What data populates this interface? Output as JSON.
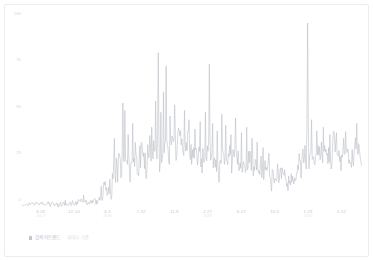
{
  "card": {
    "border_color": "#ededf0",
    "background": "#ffffff"
  },
  "legend": {
    "marker_color": "#c2c5ca",
    "series_label": "검색어트렌드",
    "sub_label": "데이터 기준"
  },
  "chart_data": {
    "type": "line",
    "title": "",
    "xlabel": "",
    "ylabel": "",
    "grid": false,
    "legend_position": "bottom-left",
    "line_color": "#bcc0c6",
    "line_width": 0.6,
    "ylim": [
      0,
      100
    ],
    "yticks": [
      0,
      25,
      50,
      75,
      100
    ],
    "ytick_labels": [
      "0",
      "25",
      "50",
      "75",
      "100"
    ],
    "xtick_positions": [
      0.055,
      0.153,
      0.251,
      0.35,
      0.448,
      0.546,
      0.645,
      0.743,
      0.841,
      0.94
    ],
    "xtick_labels": [
      "8.26",
      "12.14",
      "4.3",
      "7.22",
      "11.9",
      "2.27",
      "6.17",
      "10.5",
      "1.23",
      "5.12"
    ],
    "xtick_sublabels": [
      "2017",
      "",
      "2018",
      "",
      "",
      "2019",
      "",
      "",
      "2020",
      ""
    ],
    "n_points": 520,
    "series": [
      {
        "name": "검색어트렌드",
        "baseline_segments": [
          {
            "from": 0.0,
            "to": 0.225,
            "level": 2.2,
            "noise": 1.1
          },
          {
            "from": 0.225,
            "to": 0.265,
            "level": 6.0,
            "noise": 4.0
          },
          {
            "from": 0.265,
            "to": 0.33,
            "level": 22.0,
            "noise": 11.0
          },
          {
            "from": 0.33,
            "to": 0.42,
            "level": 27.0,
            "noise": 11.0
          },
          {
            "from": 0.42,
            "to": 0.52,
            "level": 29.0,
            "noise": 12.0
          },
          {
            "from": 0.52,
            "to": 0.62,
            "level": 28.0,
            "noise": 11.0
          },
          {
            "from": 0.62,
            "to": 0.7,
            "level": 26.0,
            "noise": 10.0
          },
          {
            "from": 0.7,
            "to": 0.77,
            "level": 21.0,
            "noise": 8.0
          },
          {
            "from": 0.77,
            "to": 0.81,
            "level": 14.0,
            "noise": 6.0
          },
          {
            "from": 0.81,
            "to": 0.87,
            "level": 26.0,
            "noise": 9.0
          },
          {
            "from": 0.87,
            "to": 1.0,
            "level": 30.0,
            "noise": 10.0
          }
        ],
        "spikes": [
          {
            "x": 0.182,
            "y": 7.5
          },
          {
            "x": 0.243,
            "y": 13.0
          },
          {
            "x": 0.258,
            "y": 16.0
          },
          {
            "x": 0.272,
            "y": 38.0
          },
          {
            "x": 0.286,
            "y": 30.0
          },
          {
            "x": 0.297,
            "y": 57.0
          },
          {
            "x": 0.303,
            "y": 53.0
          },
          {
            "x": 0.312,
            "y": 40.0
          },
          {
            "x": 0.325,
            "y": 46.0
          },
          {
            "x": 0.347,
            "y": 34.0
          },
          {
            "x": 0.362,
            "y": 30.0
          },
          {
            "x": 0.381,
            "y": 44.0
          },
          {
            "x": 0.394,
            "y": 58.0
          },
          {
            "x": 0.4,
            "y": 84.0
          },
          {
            "x": 0.409,
            "y": 52.0
          },
          {
            "x": 0.416,
            "y": 63.0
          },
          {
            "x": 0.424,
            "y": 77.0
          },
          {
            "x": 0.435,
            "y": 50.0
          },
          {
            "x": 0.448,
            "y": 56.0
          },
          {
            "x": 0.463,
            "y": 42.0
          },
          {
            "x": 0.478,
            "y": 53.0
          },
          {
            "x": 0.492,
            "y": 48.0
          },
          {
            "x": 0.509,
            "y": 43.0
          },
          {
            "x": 0.525,
            "y": 47.0
          },
          {
            "x": 0.54,
            "y": 52.0
          },
          {
            "x": 0.551,
            "y": 78.0
          },
          {
            "x": 0.56,
            "y": 46.0
          },
          {
            "x": 0.575,
            "y": 42.0
          },
          {
            "x": 0.588,
            "y": 51.0
          },
          {
            "x": 0.6,
            "y": 45.0
          },
          {
            "x": 0.615,
            "y": 40.0
          },
          {
            "x": 0.629,
            "y": 49.0
          },
          {
            "x": 0.645,
            "y": 41.0
          },
          {
            "x": 0.66,
            "y": 44.0
          },
          {
            "x": 0.676,
            "y": 38.0
          },
          {
            "x": 0.692,
            "y": 36.0
          },
          {
            "x": 0.71,
            "y": 33.0
          },
          {
            "x": 0.726,
            "y": 30.0
          },
          {
            "x": 0.84,
            "y": 100.0
          },
          {
            "x": 0.852,
            "y": 48.0
          },
          {
            "x": 0.868,
            "y": 42.0
          },
          {
            "x": 0.886,
            "y": 44.0
          },
          {
            "x": 0.905,
            "y": 40.0
          },
          {
            "x": 0.924,
            "y": 41.0
          },
          {
            "x": 0.947,
            "y": 38.0
          },
          {
            "x": 0.985,
            "y": 46.0
          }
        ]
      }
    ]
  }
}
